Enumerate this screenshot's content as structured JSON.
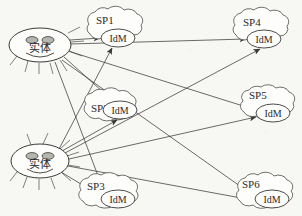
{
  "diagram": {
    "background_color": "#f7f7f4",
    "stroke_color": "#3a3a38",
    "canvas": {
      "width": 302,
      "height": 216
    }
  },
  "entities": [
    {
      "id": "entity-top",
      "label": "实体",
      "cx": 40,
      "cy": 45,
      "rx": 31,
      "ry": 17,
      "eye_fill": "#b9b9b4"
    },
    {
      "id": "entity-bottom",
      "label": "实体",
      "cx": 40,
      "cy": 161,
      "rx": 29,
      "ry": 17,
      "eye_fill": "#b9b9b4"
    }
  ],
  "providers": [
    {
      "id": "sp1",
      "label": "SP1",
      "idm_label": "IdM",
      "label_x": 96,
      "label_y": 22,
      "cloud_cx": 113,
      "cloud_cy": 29,
      "cloud_rx": 36,
      "cloud_ry": 21,
      "idm_cx": 118,
      "idm_cy": 38,
      "idm_rx": 17,
      "idm_ry": 9
    },
    {
      "id": "sp4",
      "label": "SP4",
      "idm_label": "IdM",
      "label_x": 243,
      "label_y": 24,
      "cloud_cx": 259,
      "cloud_cy": 30,
      "cloud_rx": 37,
      "cloud_ry": 21,
      "idm_cx": 264,
      "idm_cy": 39,
      "idm_rx": 17,
      "idm_ry": 9
    },
    {
      "id": "sp2",
      "label": "SP2",
      "idm_label": "IdM",
      "label_x": 92,
      "label_y": 110,
      "cloud_cx": 111,
      "cloud_cy": 108,
      "cloud_rx": 34,
      "cloud_ry": 20,
      "idm_cx": 120,
      "idm_cy": 110,
      "idm_rx": 17,
      "idm_ry": 9
    },
    {
      "id": "sp5",
      "label": "SP5",
      "idm_label": "IdM",
      "label_x": 250,
      "label_y": 97,
      "cloud_cx": 268,
      "cloud_cy": 107,
      "cloud_rx": 35,
      "cloud_ry": 21,
      "idm_cx": 273,
      "idm_cy": 113,
      "idm_rx": 17,
      "idm_ry": 9
    },
    {
      "id": "sp3",
      "label": "SP3",
      "idm_label": "IdM",
      "label_x": 88,
      "label_y": 188,
      "cloud_cx": 110,
      "cloud_cy": 193,
      "cloud_rx": 38,
      "cloud_ry": 21,
      "idm_cx": 118,
      "idm_cy": 199,
      "idm_rx": 17,
      "idm_ry": 9
    },
    {
      "id": "sp6",
      "label": "SP6",
      "idm_label": "IdM",
      "label_x": 243,
      "label_y": 186,
      "cloud_cx": 265,
      "cloud_cy": 193,
      "cloud_rx": 36,
      "cloud_ry": 21,
      "idm_cx": 272,
      "idm_cy": 199,
      "idm_rx": 17,
      "idm_ry": 9
    }
  ],
  "connections": [
    {
      "from": "entity-top",
      "to": "sp1",
      "x1": 70,
      "y1": 40,
      "x2": 100,
      "y2": 38
    },
    {
      "from": "entity-top",
      "to": "sp4",
      "x1": 70,
      "y1": 44,
      "x2": 246,
      "y2": 39
    },
    {
      "from": "entity-top",
      "to": "sp2",
      "x1": 64,
      "y1": 57,
      "x2": 116,
      "y2": 100
    },
    {
      "from": "entity-top",
      "to": "sp5",
      "x1": 68,
      "y1": 52,
      "x2": 256,
      "y2": 110
    },
    {
      "from": "entity-top",
      "to": "sp3",
      "x1": 56,
      "y1": 61,
      "x2": 104,
      "y2": 190
    },
    {
      "from": "entity-top",
      "to": "sp6",
      "x1": 62,
      "y1": 59,
      "x2": 254,
      "y2": 197
    },
    {
      "from": "entity-bottom",
      "to": "sp1",
      "x1": 60,
      "y1": 150,
      "x2": 112,
      "y2": 47
    },
    {
      "from": "entity-bottom",
      "to": "sp2",
      "x1": 62,
      "y1": 152,
      "x2": 118,
      "y2": 119
    },
    {
      "from": "entity-bottom",
      "to": "sp4",
      "x1": 64,
      "y1": 154,
      "x2": 260,
      "y2": 48
    },
    {
      "from": "entity-bottom",
      "to": "sp5",
      "x1": 69,
      "y1": 160,
      "x2": 256,
      "y2": 118
    },
    {
      "from": "entity-bottom",
      "to": "sp3",
      "x1": 62,
      "y1": 172,
      "x2": 100,
      "y2": 196
    },
    {
      "from": "entity-bottom",
      "to": "sp6",
      "x1": 68,
      "y1": 166,
      "x2": 252,
      "y2": 201
    }
  ]
}
